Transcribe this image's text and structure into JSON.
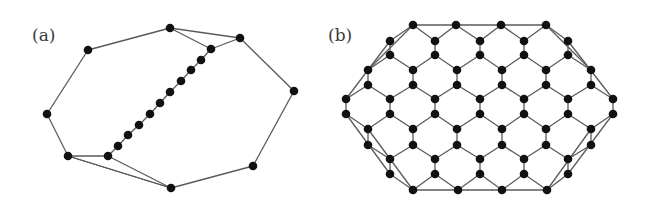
{
  "panels": [
    {
      "label": "(a)",
      "description": "Octagonal ring with a diagonal chain of nodes",
      "nodes": [
        [
          170,
          28
        ],
        [
          240,
          38
        ],
        [
          294,
          91
        ],
        [
          253,
          166
        ],
        [
          171,
          188
        ],
        [
          68,
          156
        ],
        [
          47,
          114
        ],
        [
          88,
          50
        ],
        [
          211,
          49
        ],
        [
          201,
          60
        ],
        [
          191,
          70
        ],
        [
          181,
          81
        ],
        [
          170,
          92
        ],
        [
          160,
          103
        ],
        [
          150,
          114
        ],
        [
          139,
          125
        ],
        [
          128,
          135
        ],
        [
          118,
          146
        ],
        [
          108,
          156
        ]
      ],
      "edges": [
        [
          0,
          1
        ],
        [
          1,
          2
        ],
        [
          2,
          3
        ],
        [
          3,
          4
        ],
        [
          4,
          5
        ],
        [
          5,
          6
        ],
        [
          6,
          7
        ],
        [
          7,
          0
        ],
        [
          0,
          8
        ],
        [
          8,
          1
        ],
        [
          8,
          9
        ],
        [
          9,
          10
        ],
        [
          10,
          11
        ],
        [
          11,
          12
        ],
        [
          12,
          13
        ],
        [
          13,
          14
        ],
        [
          14,
          15
        ],
        [
          15,
          16
        ],
        [
          16,
          17
        ],
        [
          17,
          18
        ],
        [
          18,
          5
        ],
        [
          18,
          4
        ],
        [
          5,
          4
        ]
      ]
    },
    {
      "label": "(b)",
      "description": "Honeycomb lattice patch with convex-hull boundary edges",
      "rows": [
        {
          "y": 25,
          "xs": [
            413,
            456,
            501,
            546
          ]
        },
        {
          "y": 41,
          "xs": [
            390,
            435,
            480,
            524,
            568
          ]
        },
        {
          "y": 55,
          "xs": [
            390,
            435,
            480,
            524,
            568
          ]
        },
        {
          "y": 70,
          "xs": [
            368,
            413,
            457,
            502,
            546,
            591
          ]
        },
        {
          "y": 85,
          "xs": [
            368,
            413,
            457,
            502,
            546,
            591
          ]
        },
        {
          "y": 99,
          "xs": [
            346,
            390,
            435,
            480,
            524,
            568,
            613
          ]
        },
        {
          "y": 114,
          "xs": [
            346,
            390,
            435,
            480,
            524,
            568,
            613
          ]
        },
        {
          "y": 129,
          "xs": [
            368,
            413,
            457,
            502,
            546,
            591
          ]
        },
        {
          "y": 145,
          "xs": [
            368,
            413,
            457,
            502,
            546,
            591
          ]
        },
        {
          "y": 159,
          "xs": [
            390,
            435,
            480,
            524,
            568
          ]
        },
        {
          "y": 174,
          "xs": [
            390,
            435,
            480,
            524,
            568
          ]
        },
        {
          "y": 190,
          "xs": [
            413,
            458,
            502,
            547
          ]
        }
      ],
      "hull_edges": [
        [
          [
            413,
            25
          ],
          [
            546,
            25
          ]
        ],
        [
          [
            413,
            190
          ],
          [
            547,
            190
          ]
        ],
        [
          [
            413,
            25
          ],
          [
            368,
            70
          ]
        ],
        [
          [
            390,
            41
          ],
          [
            346,
            99
          ]
        ],
        [
          [
            546,
            25
          ],
          [
            591,
            70
          ]
        ],
        [
          [
            568,
            41
          ],
          [
            613,
            99
          ]
        ],
        [
          [
            346,
            114
          ],
          [
            390,
            174
          ]
        ],
        [
          [
            368,
            129
          ],
          [
            413,
            190
          ]
        ],
        [
          [
            613,
            114
          ],
          [
            568,
            174
          ]
        ],
        [
          [
            591,
            129
          ],
          [
            547,
            190
          ]
        ]
      ]
    }
  ],
  "style": {
    "node_color": "#111111",
    "edge_color": "#5a5a5a",
    "node_radius": 4.3
  }
}
